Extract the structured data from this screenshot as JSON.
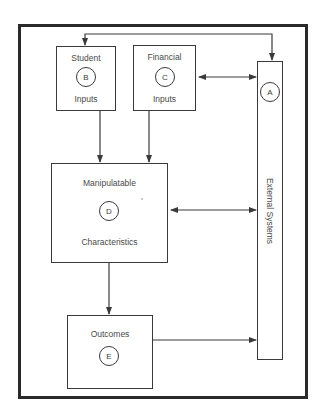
{
  "diagram": {
    "nodes": {
      "external": {
        "id": "A",
        "label": "External Systems"
      },
      "student": {
        "id": "B",
        "label_top": "Student",
        "label_bottom": "Inputs"
      },
      "financial": {
        "id": "C",
        "label_top": "Financial",
        "label_bottom": "Inputs"
      },
      "manipulatable": {
        "id": "D",
        "label_top": "Manipulatable",
        "label_bottom": "Characteristics"
      },
      "outcomes": {
        "id": "E",
        "label_top": "Outcomes"
      }
    },
    "edges": [
      {
        "from": "B",
        "to": "A",
        "type": "bidirectional",
        "route": "top loop"
      },
      {
        "from": "C",
        "to": "A",
        "type": "bidirectional"
      },
      {
        "from": "B",
        "to": "D",
        "type": "directed"
      },
      {
        "from": "C",
        "to": "D",
        "type": "directed"
      },
      {
        "from": "D",
        "to": "A",
        "type": "bidirectional"
      },
      {
        "from": "D",
        "to": "E",
        "type": "directed"
      },
      {
        "from": "E",
        "to": "A",
        "type": "directed"
      }
    ],
    "colors": {
      "line": "#3a3a3a",
      "frame": "#2a2a2a",
      "background": "#ffffff"
    }
  }
}
